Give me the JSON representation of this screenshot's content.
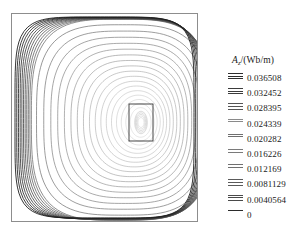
{
  "figure": {
    "kind": "magnetic-vector-potential-contour-plot",
    "frame_color": "#8d8d8d",
    "background": "#ffffff"
  },
  "legend": {
    "title_var": "A",
    "title_sub": "z",
    "title_unit": "/(Wb/m)",
    "title_full": "Az/(Wb/m)",
    "entries": [
      {
        "label": "0.036508",
        "value": 0.036508,
        "ticks": 3,
        "shade": "#2e2e2e"
      },
      {
        "label": "0.032452",
        "value": 0.032452,
        "ticks": 3,
        "shade": "#3b3b3b"
      },
      {
        "label": "0.028395",
        "value": 0.028395,
        "ticks": 3,
        "shade": "#555555"
      },
      {
        "label": "0.024339",
        "value": 0.024339,
        "ticks": 2,
        "shade": "#8a8a8a"
      },
      {
        "label": "0.020282",
        "value": 0.020282,
        "ticks": 2,
        "shade": "#6f6f6f"
      },
      {
        "label": "0.016226",
        "value": 0.016226,
        "ticks": 2,
        "shade": "#7a7a7a"
      },
      {
        "label": "0.012169",
        "value": 0.012169,
        "ticks": 2,
        "shade": "#707070"
      },
      {
        "label": "0.0081129",
        "value": 0.0081129,
        "ticks": 3,
        "shade": "#5a5a5a"
      },
      {
        "label": "0.0040564",
        "value": 0.0040564,
        "ticks": 3,
        "shade": "#4a4a4a"
      },
      {
        "label": "0",
        "value": 0,
        "ticks": 1,
        "shade": "#2b2b2b"
      }
    ]
  },
  "chart_data": {
    "type": "line",
    "title": "",
    "xlabel": "",
    "ylabel": "",
    "legend_position": "right",
    "grid": false,
    "series_name": "Az",
    "unit": "Wb/m",
    "contour_count": 28,
    "contour_levels": [
      0.0,
      0.0040564,
      0.0081129,
      0.012169,
      0.016226,
      0.020282,
      0.024339,
      0.028395,
      0.032452,
      0.036508
    ],
    "level_min": 0,
    "level_max": 0.036508,
    "level_step": 0.0040564,
    "conductor_rect": {
      "x": 128,
      "y": 103,
      "w": 24,
      "h": 37
    },
    "plot_frame": {
      "x": 11,
      "y": 13,
      "w": 187,
      "h": 209
    }
  }
}
